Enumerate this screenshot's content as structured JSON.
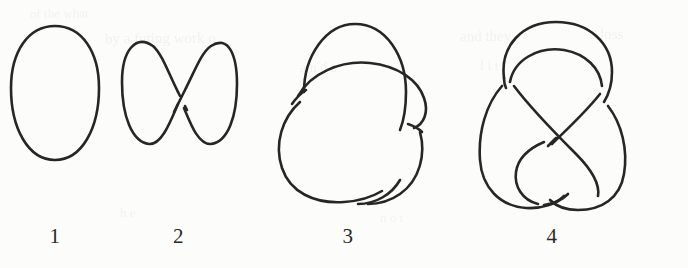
{
  "figure": {
    "background_color": "#fcfcfa",
    "ink_color": "#262626",
    "items": [
      {
        "label": "1",
        "name": "unknot",
        "crossings": 0,
        "shape": "simple closed oval loop"
      },
      {
        "label": "2",
        "name": "twisted-unknot",
        "crossings": 1,
        "shape": "figure-eight shaped loop with one crossing in the middle"
      },
      {
        "label": "3",
        "name": "trefoil-knot",
        "crossings": 3,
        "shape": "three-lobed trefoil with three alternating crossings"
      },
      {
        "label": "4",
        "name": "figure-eight-knot",
        "crossings": 4,
        "shape": "vertically elongated knot with four crossings"
      }
    ]
  },
  "bleed_through": {
    "visible": true,
    "note": "faint mirrored text showing through from the reverse of the scanned page",
    "lines": [
      {
        "text": "of the what",
        "x": 30,
        "y": 6,
        "size": 13,
        "rotate": -0.6
      },
      {
        "text": "by a futing work o",
        "x": 105,
        "y": 30,
        "size": 15,
        "rotate": -0.4
      },
      {
        "text": "and they",
        "x": 460,
        "y": 28,
        "size": 15,
        "rotate": -0.5
      },
      {
        "text": "loss",
        "x": 600,
        "y": 26,
        "size": 15,
        "rotate": -0.5
      },
      {
        "text": "a n d a",
        "x": 300,
        "y": 60,
        "size": 14,
        "rotate": -0.3
      },
      {
        "text": "l i t",
        "x": 480,
        "y": 58,
        "size": 14,
        "rotate": -0.3
      },
      {
        "text": "h e",
        "x": 120,
        "y": 205,
        "size": 13,
        "rotate": 0.4
      },
      {
        "text": "n o t",
        "x": 380,
        "y": 210,
        "size": 13,
        "rotate": 0.3
      }
    ]
  }
}
